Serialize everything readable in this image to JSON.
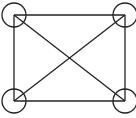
{
  "diagram": {
    "type": "graph",
    "colors": {
      "stroke": "#222222",
      "background": "#ffffff"
    },
    "nodes": [
      {
        "id": "top-left",
        "x": 14,
        "y": 15,
        "r": 12
      },
      {
        "id": "top-right",
        "x": 125,
        "y": 15,
        "r": 12
      },
      {
        "id": "bottom-left",
        "x": 14,
        "y": 101,
        "r": 12
      },
      {
        "id": "bottom-right",
        "x": 125,
        "y": 101,
        "r": 12
      }
    ],
    "edges": [
      {
        "from": "top-left",
        "to": "top-right"
      },
      {
        "from": "top-right",
        "to": "bottom-right"
      },
      {
        "from": "bottom-right",
        "to": "bottom-left"
      },
      {
        "from": "bottom-left",
        "to": "top-left"
      },
      {
        "from": "top-left",
        "to": "bottom-right"
      },
      {
        "from": "top-right",
        "to": "bottom-left"
      }
    ]
  }
}
